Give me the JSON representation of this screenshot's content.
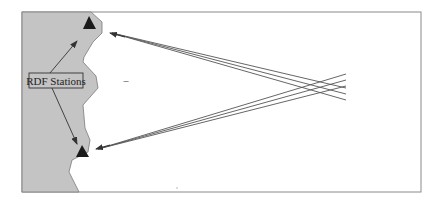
{
  "diagram": {
    "label": "RDF Stations",
    "colors": {
      "land": "#c4c4c4",
      "frame": "#8a8a8a",
      "station": "#1a1a1a",
      "bearing_line": "#555555",
      "arrow": "#333333"
    },
    "stations": [
      {
        "name": "station-north",
        "x": 90,
        "y": 22
      },
      {
        "name": "station-south",
        "x": 83,
        "y": 152
      }
    ],
    "bearing_lines": {
      "from_north_station_count": 3,
      "from_south_station_count": 3
    },
    "minus_mark": "–"
  }
}
